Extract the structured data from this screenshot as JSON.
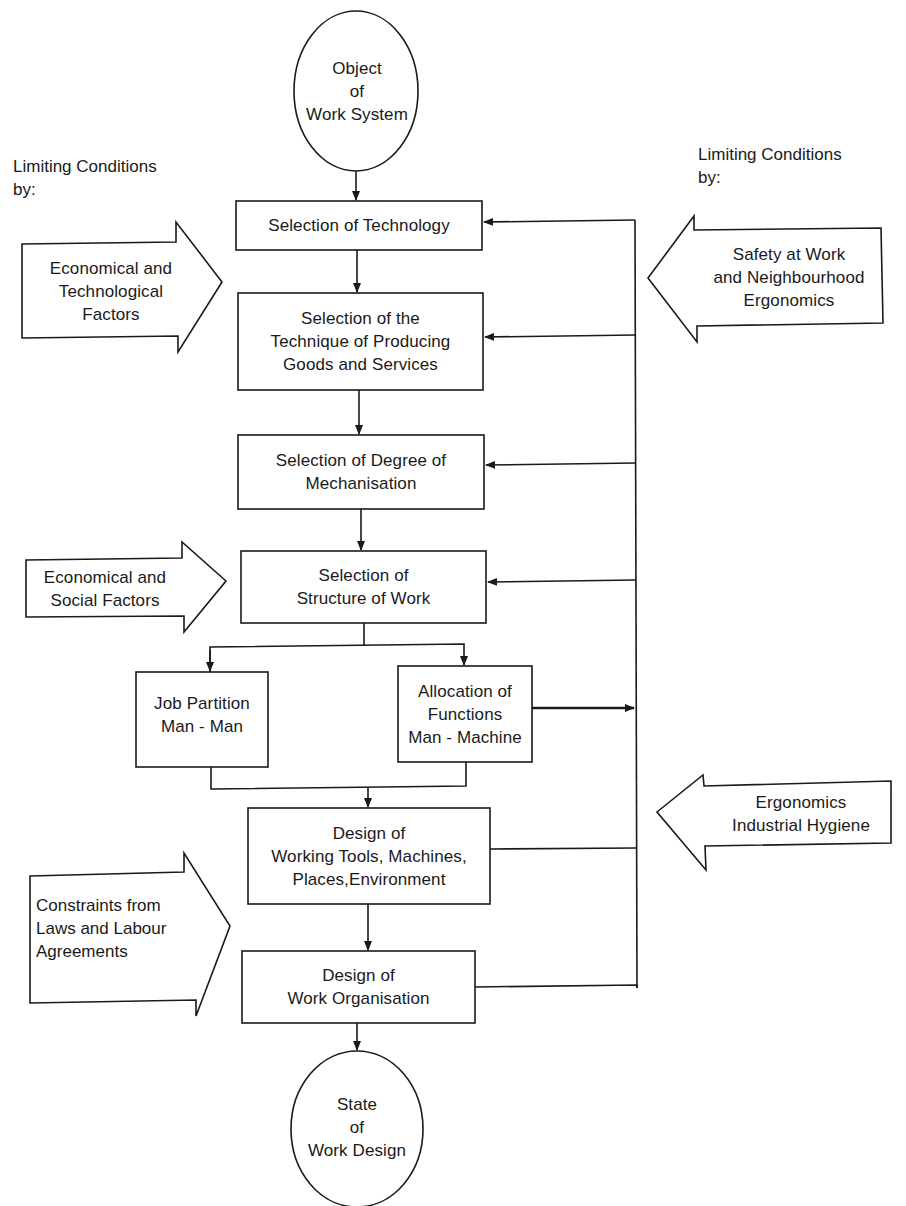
{
  "diagram": {
    "start_node": {
      "lines": [
        "Object",
        "of",
        "Work System"
      ]
    },
    "end_node": {
      "lines": [
        "State",
        "of",
        "Work Design"
      ]
    },
    "left_heading": {
      "lines": [
        "Limiting Conditions",
        "by:"
      ]
    },
    "right_heading": {
      "lines": [
        "Limiting Conditions",
        "by:"
      ]
    },
    "steps": [
      {
        "id": "selection-of-technology",
        "lines": [
          "Selection of Technology"
        ]
      },
      {
        "id": "selection-of-technique",
        "lines": [
          "Selection of the",
          "Technique of Producing",
          "Goods and Services"
        ]
      },
      {
        "id": "selection-of-degree-of-mechanisation",
        "lines": [
          "Selection of Degree of",
          "Mechanisation"
        ]
      },
      {
        "id": "selection-of-structure-of-work",
        "lines": [
          "Selection of",
          "Structure of Work"
        ]
      },
      {
        "id": "job-partition",
        "lines": [
          "Job Partition",
          "Man - Man"
        ]
      },
      {
        "id": "allocation-of-functions",
        "lines": [
          "Allocation of",
          "Functions",
          "Man - Machine"
        ]
      },
      {
        "id": "design-of-working-tools",
        "lines": [
          "Design of",
          "Working Tools, Machines,",
          "Places,Environment"
        ]
      },
      {
        "id": "design-of-work-organisation",
        "lines": [
          "Design of",
          "Work Organisation"
        ]
      }
    ],
    "left_factors": [
      {
        "id": "economical-technological-factors",
        "lines": [
          "Economical and",
          "Technological",
          "Factors"
        ]
      },
      {
        "id": "economical-social-factors",
        "lines": [
          "Economical and",
          "Social Factors"
        ]
      },
      {
        "id": "constraints-laws-labour",
        "lines": [
          "Constraints from",
          "Laws and Labour",
          "Agreements"
        ]
      }
    ],
    "right_factors": [
      {
        "id": "safety-neighbourhood-ergonomics",
        "lines": [
          "Safety at Work",
          "and Neighbourhood",
          "Ergonomics"
        ]
      },
      {
        "id": "ergonomics-industrial-hygiene",
        "lines": [
          "Ergonomics",
          "Industrial Hygiene"
        ]
      }
    ],
    "colors": {
      "ink": "#1a1a1a",
      "background": "#ffffff"
    }
  }
}
